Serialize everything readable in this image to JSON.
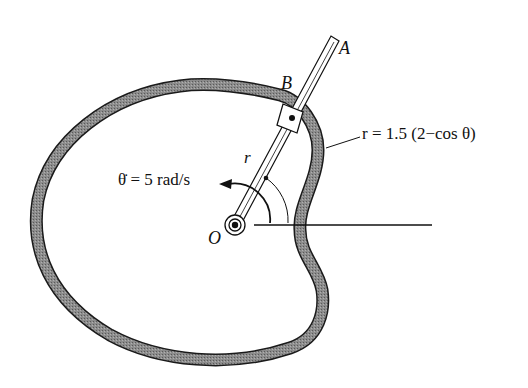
{
  "figure": {
    "labels": {
      "point_a": "A",
      "point_b": "B",
      "origin": "O",
      "radius": "r",
      "angle": "θ",
      "equation": "r = 1.5 (2−cos θ)",
      "angular_velocity": "θ̇ = 5 rad/s"
    },
    "colors": {
      "ink": "#111111",
      "track_fill": "#8a8a8a",
      "background": "#ffffff"
    }
  }
}
